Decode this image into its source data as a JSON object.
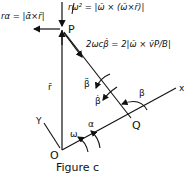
{
  "figure": {
    "caption": "Figure c",
    "points": {
      "P": "P",
      "Q": "Q",
      "O": "O"
    },
    "axes": {
      "x": "x",
      "y": "Y"
    },
    "vectors": {
      "r": "r̄",
      "beta_ddot": "β̈",
      "beta_dot": "β̇"
    },
    "angles": {
      "beta": "β",
      "omega": "ω",
      "alpha": "α"
    },
    "equations": {
      "tangential": "rα = |ᾱ×r̄|",
      "normal": "rω² = |ω̄ × (ω̄×r̄)|",
      "coriolis": "2ωcβ̇ = 2|ω̄ × v̄P/B|"
    },
    "colors": {
      "ink": "#111111",
      "background": "#ffffff"
    }
  }
}
